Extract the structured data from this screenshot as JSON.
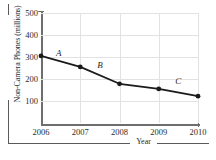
{
  "chart_data": {
    "type": "line",
    "title": "",
    "subtitle": "",
    "xlabel": "Year",
    "ylabel": "Non-Camera Phones (millions)",
    "x": [
      2006,
      2007,
      2008,
      2009,
      2010
    ],
    "categories": [
      "2006",
      "2007",
      "2008",
      "2009",
      "2010"
    ],
    "values": [
      305,
      255,
      178,
      155,
      122
    ],
    "series": [
      {
        "name": "Non-Camera Phones",
        "values": [
          305,
          255,
          178,
          155,
          122
        ]
      }
    ],
    "xtick_labels": [
      "2006",
      "2007",
      "2008",
      "2009",
      "2010"
    ],
    "ytick_labels": [
      "100",
      "200",
      "300",
      "400",
      "500"
    ],
    "ytick_values": [
      100,
      200,
      300,
      400,
      500
    ],
    "xlim": [
      2006,
      2010
    ],
    "ylim": [
      0,
      500
    ],
    "grid": true,
    "legend": "none",
    "marker": "circle",
    "line_color": "#1a1a1a",
    "grid_color": "#e2e2e2",
    "axis_color": "#6e6e6e",
    "annotations": [
      {
        "label": "A",
        "segment": "2006-2007",
        "x": 2006.45,
        "y": 320
      },
      {
        "label": "B",
        "segment": "2007-2008",
        "x": 2007.5,
        "y": 262
      },
      {
        "label": "C",
        "segment": "2009-2010",
        "x": 2009.5,
        "y": 190
      }
    ]
  },
  "axes": {
    "y_title": "Non-Camera Phones (millions)",
    "x_title": "Year"
  }
}
